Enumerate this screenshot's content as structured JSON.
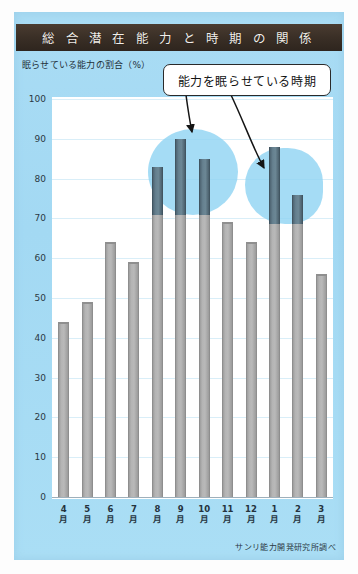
{
  "poster": {
    "title": "総 合 潜 在 能 力 と 時 期 の 関 係",
    "source": "サンリ能力開発研究所調べ",
    "callout": "能力を眠らせている時期",
    "background_color": "#a5daf5",
    "title_band_color": "#3a2f26",
    "bar_color": "#b4b4b4",
    "highlight_bar_color": "#65808f",
    "highlight_blob_color": "#8ed3f2"
  },
  "chart_data": {
    "type": "bar",
    "xlabel": "",
    "ylabel": "眠らせている能力の割合（%）",
    "ylim": [
      0,
      100
    ],
    "yticks": [
      100,
      90,
      80,
      70,
      60,
      50,
      40,
      30,
      20,
      10,
      0
    ],
    "grid": true,
    "legend": "none",
    "categories": [
      "4月",
      "5月",
      "6月",
      "7月",
      "8月",
      "9月",
      "10月",
      "11月",
      "12月",
      "1月",
      "2月",
      "3月"
    ],
    "category_numbers": [
      "4",
      "5",
      "6",
      "7",
      "8",
      "9",
      "10",
      "11",
      "12",
      "1",
      "2",
      "3"
    ],
    "category_unit": "月",
    "values": [
      44,
      49,
      64,
      59,
      83,
      90,
      85,
      69,
      64,
      88,
      76,
      56
    ],
    "highlighted_categories": [
      "8月",
      "9月",
      "10月",
      "1月",
      "2月"
    ],
    "annotations": [
      {
        "text": "能力を眠らせている時期",
        "points_to": [
          "9月",
          "1月"
        ]
      }
    ],
    "source": "サンリ能力開発研究所調べ"
  }
}
